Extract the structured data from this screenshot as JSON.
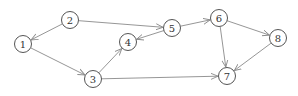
{
  "diagram": {
    "type": "directed-graph",
    "node_radius": 8.5,
    "colors": {
      "edge": "#8a8a8a",
      "node_stroke": "#555555",
      "label": "#333333",
      "background": "#ffffff"
    },
    "nodes": [
      {
        "id": "1",
        "label": "1",
        "x": 23,
        "y": 44
      },
      {
        "id": "2",
        "label": "2",
        "x": 70,
        "y": 20
      },
      {
        "id": "3",
        "label": "3",
        "x": 93,
        "y": 79
      },
      {
        "id": "4",
        "label": "4",
        "x": 128,
        "y": 42
      },
      {
        "id": "5",
        "label": "5",
        "x": 172,
        "y": 28
      },
      {
        "id": "6",
        "label": "6",
        "x": 219,
        "y": 18
      },
      {
        "id": "7",
        "label": "7",
        "x": 227,
        "y": 76
      },
      {
        "id": "8",
        "label": "8",
        "x": 278,
        "y": 38
      }
    ],
    "edges": [
      {
        "from": "2",
        "to": "1"
      },
      {
        "from": "1",
        "to": "3"
      },
      {
        "from": "3",
        "to": "4"
      },
      {
        "from": "2",
        "to": "5"
      },
      {
        "from": "5",
        "to": "4"
      },
      {
        "from": "5",
        "to": "6"
      },
      {
        "from": "6",
        "to": "8"
      },
      {
        "from": "6",
        "to": "7"
      },
      {
        "from": "8",
        "to": "7"
      },
      {
        "from": "3",
        "to": "7"
      }
    ]
  }
}
